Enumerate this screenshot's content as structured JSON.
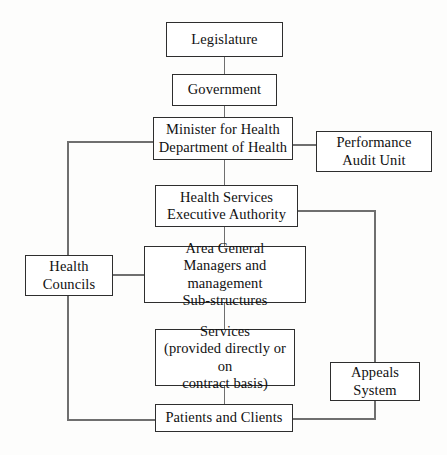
{
  "diagram": {
    "type": "organizational-flowchart",
    "background_color": "#fdfdfc",
    "box_border_color": "#2e2e2e",
    "connector_color": "#6f6f6f",
    "text_color": "#111111"
  },
  "nodes": {
    "legislature": {
      "label": "Legislature"
    },
    "government": {
      "label": "Government"
    },
    "minister": {
      "label": "Minister for Health\nDepartment of Health"
    },
    "performance_audit_unit": {
      "label": "Performance\nAudit Unit"
    },
    "health_services_executive_authority": {
      "label": "Health Services\nExecutive Authority"
    },
    "area_general_managers": {
      "label": "Area General\nManagers and management\nSub-structures"
    },
    "health_councils": {
      "label": "Health\nCouncils"
    },
    "services": {
      "label": "Services\n(provided directly or on\ncontract basis)"
    },
    "appeals_system": {
      "label": "Appeals\nSystem"
    },
    "patients_and_clients": {
      "label": "Patients and Clients"
    }
  },
  "connections": [
    {
      "from": "legislature",
      "to": "government",
      "style": "vertical"
    },
    {
      "from": "government",
      "to": "minister",
      "style": "vertical"
    },
    {
      "from": "minister",
      "to": "performance_audit_unit",
      "style": "horizontal"
    },
    {
      "from": "minister",
      "to": "health_services_executive_authority",
      "style": "vertical"
    },
    {
      "from": "minister",
      "to": "patients_and_clients",
      "style": "left-elbow"
    },
    {
      "from": "health_services_executive_authority",
      "to": "area_general_managers",
      "style": "vertical"
    },
    {
      "from": "health_services_executive_authority",
      "to": "patients_and_clients",
      "style": "right-elbow-through-appeals"
    },
    {
      "from": "health_councils",
      "to": "area_general_managers",
      "style": "horizontal"
    },
    {
      "from": "area_general_managers",
      "to": "services",
      "style": "vertical"
    },
    {
      "from": "services",
      "to": "patients_and_clients",
      "style": "vertical"
    },
    {
      "from": "patients_and_clients",
      "to": "appeals_system",
      "style": "right-elbow"
    }
  ]
}
